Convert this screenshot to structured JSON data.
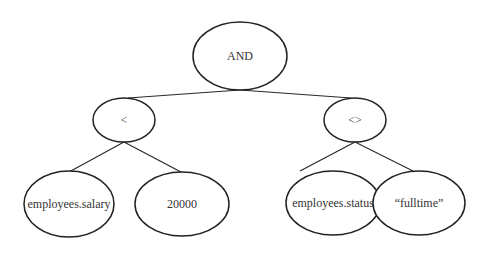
{
  "diagram": {
    "type": "expression-tree",
    "nodes": [
      {
        "id": "and",
        "label": "AND",
        "cx": 240,
        "cy": 56,
        "rx": 47,
        "ry": 34
      },
      {
        "id": "lt",
        "label": "<",
        "cx": 124,
        "cy": 120,
        "rx": 31,
        "ry": 22
      },
      {
        "id": "ne",
        "label": "<>",
        "cx": 355,
        "cy": 120,
        "rx": 31,
        "ry": 22
      },
      {
        "id": "salary",
        "label": "employees.salary",
        "cx": 69,
        "cy": 204,
        "rx": 45,
        "ry": 33
      },
      {
        "id": "num",
        "label": "20000",
        "cx": 182,
        "cy": 204,
        "rx": 47,
        "ry": 32
      },
      {
        "id": "status",
        "label": "employees.status",
        "cx": 333,
        "cy": 203,
        "rx": 47,
        "ry": 32
      },
      {
        "id": "fulltime",
        "label": "“fulltime”",
        "cx": 419,
        "cy": 203,
        "rx": 46,
        "ry": 32
      }
    ],
    "edges": [
      {
        "from": "and",
        "to": "lt",
        "x1": 240,
        "y1": 90,
        "x2": 128,
        "y2": 98
      },
      {
        "from": "and",
        "to": "ne",
        "x1": 240,
        "y1": 90,
        "x2": 351,
        "y2": 98
      },
      {
        "from": "lt",
        "to": "salary",
        "x1": 124,
        "y1": 142,
        "x2": 69,
        "y2": 172
      },
      {
        "from": "lt",
        "to": "num",
        "x1": 124,
        "y1": 142,
        "x2": 181,
        "y2": 172
      },
      {
        "from": "ne",
        "to": "status",
        "x1": 355,
        "y1": 142,
        "x2": 300,
        "y2": 171
      },
      {
        "from": "ne",
        "to": "fulltime",
        "x1": 355,
        "y1": 142,
        "x2": 413,
        "y2": 171
      }
    ]
  }
}
